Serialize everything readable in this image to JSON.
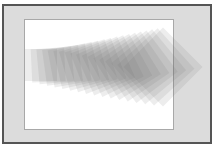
{
  "illustration": {
    "description": "Sequence of semi-transparent squares rotating from 0° to 45° while growing and moving right",
    "colors": {
      "background": "#ffffff",
      "frame_fill": "#dcdcdc",
      "frame_border": "#555555",
      "panel_fill": "#ffffff",
      "panel_border": "#a8a8a8",
      "square_fill": "#6e6e6e"
    },
    "squares": {
      "count": 18,
      "start": {
        "cx": 41,
        "cy": 65,
        "size": 32,
        "angle": 0
      },
      "end": {
        "cx": 163,
        "cy": 67,
        "size": 56,
        "angle": 45
      },
      "opacity": 0.12
    }
  }
}
